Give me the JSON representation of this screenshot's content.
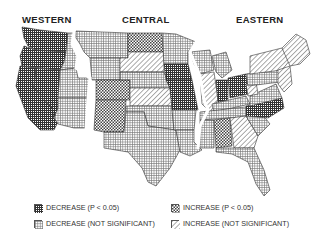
{
  "figure": {
    "regions": [
      {
        "label": "WESTERN",
        "x": 22
      },
      {
        "label": "CENTRAL",
        "x": 122
      },
      {
        "label": "EASTERN",
        "x": 236
      }
    ]
  },
  "legend": {
    "items": [
      {
        "id": "dec_sig",
        "label": "DECREASE (P < 0.05)",
        "pattern": "dense-grid"
      },
      {
        "id": "inc_sig",
        "label": "INCREASE (P < 0.05)",
        "pattern": "checker"
      },
      {
        "id": "dec_ns",
        "label": "DECREASE (NOT SIGNIFICANT)",
        "pattern": "light-grid"
      },
      {
        "id": "inc_ns",
        "label": "INCREASE (NOT SIGNIFICANT)",
        "pattern": "diagonal"
      }
    ]
  },
  "colors": {
    "ink": "#222222",
    "paper": "#ffffff"
  }
}
